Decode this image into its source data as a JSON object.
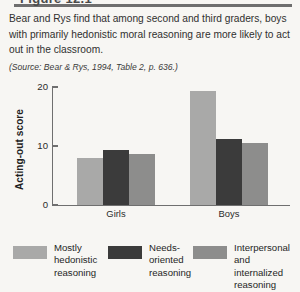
{
  "figure": {
    "title": "Figure 12.1",
    "description": "Bear and Rys find that among second and third graders, boys with primarily hedonistic moral reasoning are more likely to act out in the classroom.",
    "source": "(Source: Bear & Rys, 1994, Table 2, p. 636.)"
  },
  "colors": {
    "series_1": "#a9a9a8",
    "series_2": "#3b3b3b",
    "series_3": "#8d8d8c",
    "axis": "#6f6f6f",
    "page_background": "#f7f6f3",
    "text": "#2b2b2b"
  },
  "chart_data": {
    "type": "bar",
    "title": "",
    "xlabel": "",
    "ylabel": "Acting-out score",
    "categories": [
      "Girls",
      "Boys"
    ],
    "ylim": [
      0,
      20
    ],
    "yticks": [
      0,
      10,
      20
    ],
    "ytick_labels": [
      "0",
      "10",
      "20"
    ],
    "grid": false,
    "legend_position": "bottom",
    "series": [
      {
        "name": "Mostly hedonistic reasoning",
        "color": "#a9a9a8",
        "values": [
          8.0,
          19.4
        ]
      },
      {
        "name": "Needs-oriented reasoning",
        "color": "#3b3b3b",
        "values": [
          9.3,
          11.2
        ]
      },
      {
        "name": "Interpersonal and internalized reasoning",
        "color": "#8d8d8c",
        "values": [
          8.7,
          10.5
        ]
      }
    ]
  },
  "legend": {
    "items": [
      {
        "label_line_1": "Mostly",
        "label_line_2": "hedonistic",
        "label_line_3": "reasoning",
        "color": "#a9a9a8"
      },
      {
        "label_line_1": "Needs-",
        "label_line_2": "oriented",
        "label_line_3": "reasoning",
        "color": "#3b3b3b"
      },
      {
        "label_line_1": "Interpersonal",
        "label_line_2": "and internalized",
        "label_line_3": "reasoning",
        "color": "#8d8d8c"
      }
    ]
  }
}
